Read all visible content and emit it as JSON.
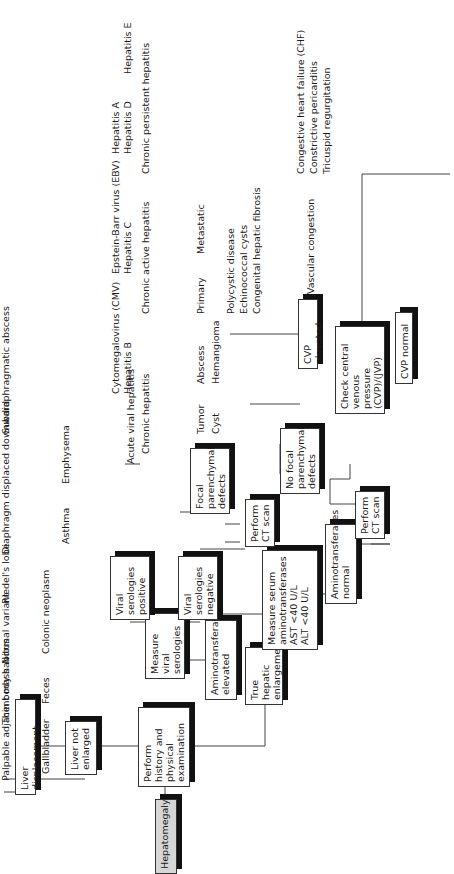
{
  "diagram": {
    "type": "flowchart",
    "orientation": "rotated-90-ccw",
    "start": "Hepatomegaly",
    "nodes": {
      "hepatomegaly": "Hepatomegaly",
      "history": "Perform history and physical examination",
      "liver_not_enlarged": "Liver not enlarged",
      "liver_displacement": "Liver displacement",
      "true_enlargement": "True hepatic enlargement",
      "measure_serum": "Measure serum aminotransferases",
      "ast": "AST <40 U/L",
      "alt": "ALT <40 U/L",
      "amino_elevated": "Aminotransferases elevated",
      "amino_normal": "Aminotransferases normal",
      "measure_viral": "Measure viral serologies",
      "viral_positive": "Viral serologies positive",
      "viral_negative": "Viral serologies negative",
      "ct_scan_1": "Perform CT scan",
      "ct_scan_2": "Perform CT scan",
      "focal_defects": "Focal parenchymal defects",
      "no_focal_defects": "No focal parenchymal defects",
      "check_cvp": "Check central venous pressure (CVP)/(JVP)",
      "cvp_elevated": "CVP elevated",
      "cvp_normal": "CVP normal"
    },
    "displacement_causes": [
      "Palpable adjacent mass",
      "Thin body habitus",
      "Normal variant",
      "Riedel's lobe",
      "Diaphragm displaced downward",
      "Subdiaphragmatic abscess"
    ],
    "adjacent_mass_causes": [
      "Gallbladder",
      "Feces",
      "Colonic neoplasm"
    ],
    "diaphragm_causes": [
      "Asthma",
      "Emphysema"
    ],
    "viral_positive_causes": {
      "acute": "Acute viral hepatitis",
      "chronic": "Chronic hepatitis"
    },
    "acute_viral_agents": [
      "Cytomegalovirus (CMV)",
      "Epstein-Barr virus (EBV)",
      "Hepatitis A",
      "Hepatitis B",
      "Hepatitis C",
      "Hepatitis D",
      "Hepatitis E"
    ],
    "chronic_types": [
      "Chronic active hepatitis",
      "Chronic persistent hepatitis"
    ],
    "focal_causes": [
      "Tumor",
      "Abscess",
      "Cyst",
      "Hemangioma"
    ],
    "tumor_types": [
      "Primary",
      "Metastatic"
    ],
    "cyst_types": [
      "Polycystic disease",
      "Echinococcal cysts",
      "Congenital hepatic fibrosis"
    ],
    "cvp_elevated_cause": "Vascular congestion",
    "vascular_causes": [
      "Congestive heart failure (CHF)",
      "Constrictive pericarditis",
      "Tricuspid regurgitation"
    ]
  }
}
